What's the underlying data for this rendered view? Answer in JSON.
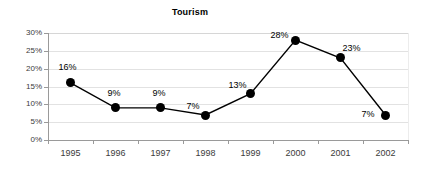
{
  "chart_data": {
    "type": "line",
    "title": "Tourism",
    "xlabel": "",
    "ylabel": "",
    "categories": [
      "1995",
      "1996",
      "1997",
      "1998",
      "1999",
      "2000",
      "2001",
      "2002"
    ],
    "values": [
      16,
      9,
      9,
      7,
      13,
      28,
      23,
      7
    ],
    "data_labels": [
      "16%",
      "9%",
      "9%",
      "7%",
      "13%",
      "28%",
      "23%",
      "7%"
    ],
    "ytick_labels": [
      "0%",
      "5%",
      "10%",
      "15%",
      "20%",
      "25%",
      "30%"
    ],
    "ytick_values": [
      0,
      5,
      10,
      15,
      20,
      25,
      30
    ],
    "ylim": [
      0,
      30
    ],
    "grid": true,
    "legend": false,
    "series_color": "#000000",
    "grid_color": "#e2e2e2",
    "axis_color": "#9a9a9a",
    "marker": "filled-circle"
  }
}
